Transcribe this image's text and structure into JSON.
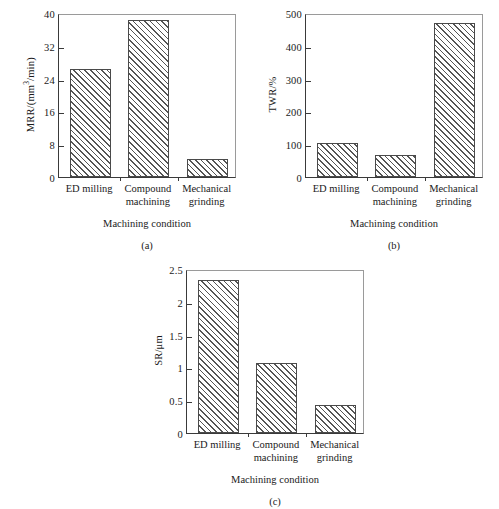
{
  "figure": {
    "categories": [
      "ED milling",
      "Compound machining",
      "Mechanical grinding"
    ],
    "category_lines": [
      [
        "ED milling",
        ""
      ],
      [
        "Compound",
        "machining"
      ],
      [
        "Mechanical",
        "grinding"
      ]
    ],
    "x_axis_title": "Machining condition",
    "captions": {
      "a": "(a)",
      "b": "(b)",
      "c": "(c)"
    }
  },
  "chart_data": [
    {
      "type": "bar",
      "panel": "(a)",
      "title": "",
      "categories": [
        "ED milling",
        "Compound machining",
        "Mechanical grinding"
      ],
      "values": [
        26.4,
        38.2,
        4.4
      ],
      "xlabel": "Machining condition",
      "ylabel": "MRR/(mm3/min)",
      "ylabel_parts": {
        "pre": "MRR/(mm",
        "sup": "3",
        "post": "/min)"
      },
      "ylim": [
        0,
        40
      ],
      "yticks": [
        0,
        8,
        16,
        24,
        32,
        40
      ],
      "ytick_labels": [
        "0",
        "8",
        "16",
        "24",
        "32",
        "40"
      ],
      "grid": false,
      "legend": "none"
    },
    {
      "type": "bar",
      "panel": "(b)",
      "title": "",
      "categories": [
        "ED milling",
        "Compound machining",
        "Mechanical grinding"
      ],
      "values": [
        105,
        67,
        470
      ],
      "xlabel": "Machining condition",
      "ylabel": "TWR/%",
      "ylim": [
        0,
        500
      ],
      "yticks": [
        0,
        100,
        200,
        300,
        400,
        500
      ],
      "ytick_labels": [
        "0",
        "100",
        "200",
        "300",
        "400",
        "500"
      ],
      "grid": false,
      "legend": "none"
    },
    {
      "type": "bar",
      "panel": "(c)",
      "title": "",
      "categories": [
        "ED milling",
        "Compound machining",
        "Mechanical grinding"
      ],
      "values": [
        2.33,
        1.06,
        0.43
      ],
      "xlabel": "Machining condition",
      "ylabel": "SR/μm",
      "ylim": [
        0,
        2.5
      ],
      "yticks": [
        0,
        0.5,
        1,
        1.5,
        2,
        2.5
      ],
      "ytick_labels": [
        "0",
        "0.5",
        "1",
        "1.5",
        "2",
        "2.5"
      ],
      "grid": false,
      "legend": "none"
    }
  ],
  "colors": {
    "axis": "#3a3a3a",
    "bar_edge": "#4a4a4a",
    "hatch": "#555555",
    "background": "#ffffff"
  }
}
